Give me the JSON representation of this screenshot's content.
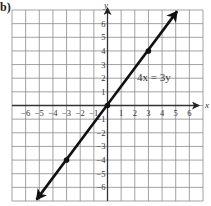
{
  "part_label": "b)",
  "chart_data": {
    "type": "line",
    "title": "",
    "equation_label": "4x = 3y",
    "xlabel": "x",
    "ylabel": "y",
    "xlim": [
      -7,
      7
    ],
    "ylim": [
      -7,
      7
    ],
    "grid": true,
    "x_ticks": [
      -6,
      -5,
      -4,
      -3,
      -2,
      -1,
      1,
      2,
      3,
      4,
      5,
      6
    ],
    "y_ticks": [
      -6,
      -5,
      -4,
      -3,
      -2,
      -1,
      1,
      2,
      3,
      4,
      5,
      6
    ],
    "series": [
      {
        "name": "4x = 3y",
        "slope": 1.3333,
        "intercept": 0,
        "marked_points": [
          [
            -3,
            -4
          ],
          [
            0,
            0
          ],
          [
            3,
            4
          ]
        ],
        "arrow_ends": [
          [
            -5.2,
            -6.9
          ],
          [
            5.1,
            6.9
          ]
        ]
      }
    ]
  },
  "colors": {
    "grid": "#8a8a8a",
    "axis": "#333333",
    "line": "#111111",
    "text": "#333333"
  }
}
